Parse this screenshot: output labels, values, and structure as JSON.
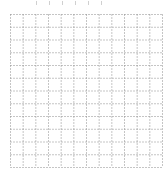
{
  "grid": {
    "columns": 12,
    "rows": 12,
    "line_color": "#8a8a8a",
    "line_style": "dotted",
    "background": "#ffffff"
  },
  "top_marks": {
    "count": 6,
    "color": "#d0d0d0"
  }
}
